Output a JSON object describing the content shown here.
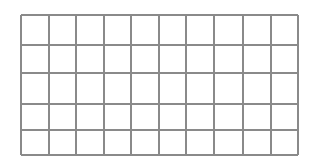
{
  "grid": {
    "columns": 10,
    "rows": 5,
    "line_color": "#8a8a8a",
    "background": "#ffffff",
    "column_positions": [
      0,
      28,
      55,
      83,
      110,
      138,
      165,
      193,
      222,
      250,
      277
    ],
    "row_positions": [
      0,
      30,
      58,
      89,
      115,
      140
    ]
  }
}
